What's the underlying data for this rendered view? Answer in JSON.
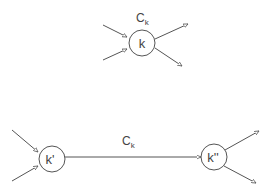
{
  "top": {
    "label": "C",
    "label_sub": "k",
    "node": "k"
  },
  "bottom": {
    "label": "C",
    "label_sub": "k",
    "left_node": "k'",
    "right_node": "k''"
  },
  "colors": {
    "stroke": "#555555",
    "background": "#ffffff"
  }
}
